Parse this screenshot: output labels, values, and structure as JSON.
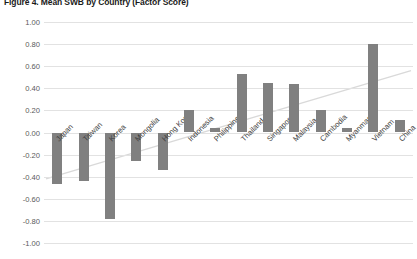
{
  "figure": {
    "title": "Figure 4. Mean SWB by Country (Factor Score)"
  },
  "chart_data": {
    "type": "bar",
    "title": "Figure 4. Mean SWB by Country (Factor Score)",
    "xlabel": "",
    "ylabel": "",
    "ylim": [
      -1.0,
      1.0
    ],
    "ytick_labels": [
      "1.00",
      "0.80",
      "0.60",
      "0.40",
      "0.20",
      "0.00",
      "-0.20",
      "-0.40",
      "-0.60",
      "-0.80",
      "-1.00"
    ],
    "ytick_values": [
      1.0,
      0.8,
      0.6,
      0.4,
      0.2,
      0.0,
      -0.2,
      -0.4,
      -0.6,
      -0.8,
      -1.0
    ],
    "grid": true,
    "legend": "none",
    "bar_color": "#808080",
    "trendline": {
      "present": true,
      "style": "linear, light gray",
      "color": "#d9d9d9",
      "y_start": -0.42,
      "y_end": 0.56
    },
    "categories": [
      "Japan",
      "Taiwan",
      "Korea",
      "Mongolia",
      "Hong Kong",
      "Indonesia",
      "Philippines",
      "Thailand",
      "Singapore",
      "Malaysia",
      "Cambodia",
      "Myanmar",
      "Vietnam",
      "China"
    ],
    "values": [
      -0.47,
      -0.44,
      -0.78,
      -0.26,
      -0.34,
      0.2,
      0.04,
      0.53,
      0.45,
      0.44,
      0.2,
      0.04,
      0.8,
      0.11
    ]
  }
}
